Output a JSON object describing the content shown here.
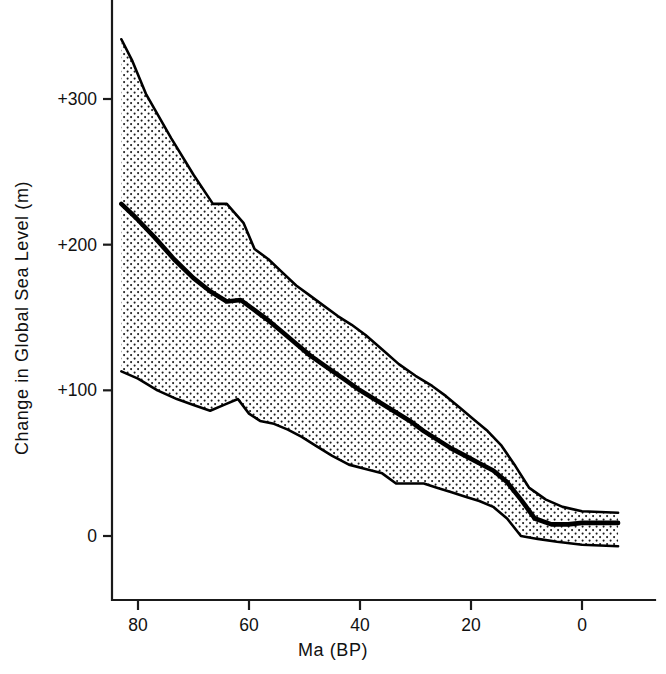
{
  "figure": {
    "title": "",
    "background": "#ffffff",
    "ink_color": "#000000"
  },
  "axes": {
    "y": {
      "label": "Change in Global Sea Level  (m)",
      "tick_labels": [
        "+300",
        "+200",
        "+100",
        "0"
      ],
      "tick_values": [
        300,
        200,
        100,
        0
      ],
      "range": [
        -40,
        350
      ],
      "units": "m"
    },
    "x": {
      "label": "Ma (BP)",
      "tick_labels": [
        "80",
        "60",
        "40",
        "20",
        "0"
      ],
      "tick_values": [
        80,
        60,
        40,
        20,
        0
      ],
      "range": [
        83,
        0
      ],
      "units": "Ma",
      "direction": "reversed"
    }
  },
  "chart_data": {
    "type": "area",
    "title": "",
    "xlabel": "Ma (BP)",
    "ylabel": "Change in Global Sea Level  (m)",
    "xlim": [
      83,
      0
    ],
    "ylim": [
      -40,
      350
    ],
    "grid": false,
    "legend": null,
    "x_axis_reversed": true,
    "band_fill_style": "stipple-dot",
    "band_fill_color": "#f2f2f2",
    "series": [
      {
        "name": "Upper bound",
        "style": "thin solid line (band upper envelope)",
        "x": [
          83.0,
          81.0,
          78.5,
          74.0,
          70.0,
          66.5,
          64.0,
          61.0,
          59.0,
          56.5,
          54.0,
          51.5,
          49.0,
          46.5,
          44.0,
          41.5,
          39.0,
          36.0,
          33.0,
          30.0,
          27.0,
          24.5,
          22.0,
          19.5,
          17.0,
          14.5,
          12.0,
          9.5,
          6.5,
          3.5,
          0.0,
          -6.5
        ],
        "values": [
          341,
          326,
          303,
          273,
          248,
          228,
          228,
          215,
          197,
          190,
          181,
          172,
          165,
          158,
          151,
          145,
          138,
          128,
          118,
          110,
          103,
          96,
          88,
          80,
          72,
          62,
          48,
          33,
          25,
          20,
          17,
          16
        ]
      },
      {
        "name": "Best estimate",
        "style": "thick solid line",
        "x": [
          83.0,
          80.5,
          77.0,
          73.5,
          70.0,
          67.0,
          64.0,
          61.5,
          59.0,
          56.5,
          54.0,
          51.5,
          49.0,
          46.0,
          43.0,
          40.0,
          37.0,
          34.0,
          31.0,
          28.5,
          26.0,
          23.5,
          21.0,
          18.5,
          16.0,
          13.5,
          11.0,
          8.5,
          5.5,
          2.5,
          0.0,
          -6.5
        ],
        "values": [
          228,
          219,
          205,
          190,
          177,
          168,
          161,
          162,
          155,
          148,
          140,
          132,
          124,
          116,
          108,
          100,
          93,
          86,
          79,
          72,
          66,
          60,
          55,
          50,
          45,
          37,
          25,
          12,
          8,
          8,
          9,
          9
        ]
      },
      {
        "name": "Lower bound",
        "style": "thin solid line (band lower envelope)",
        "x": [
          83.0,
          80.0,
          76.5,
          73.0,
          70.0,
          67.0,
          64.5,
          62.0,
          60.0,
          58.0,
          55.5,
          53.0,
          50.5,
          48.0,
          45.0,
          42.0,
          39.0,
          36.0,
          33.5,
          31.0,
          28.5,
          26.0,
          23.5,
          21.0,
          18.5,
          16.0,
          13.5,
          11.0,
          8.0,
          4.5,
          0.0,
          -6.5
        ],
        "values": [
          113,
          108,
          100,
          94,
          90,
          86,
          90,
          94,
          84,
          79,
          77,
          73,
          68,
          62,
          55,
          49,
          46,
          43,
          36,
          36,
          36,
          33,
          30,
          27,
          24,
          20,
          12,
          0,
          -2,
          -4,
          -6,
          -7
        ]
      }
    ]
  },
  "annotations": []
}
